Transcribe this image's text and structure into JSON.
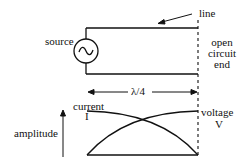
{
  "labels": {
    "line": "line",
    "source": "source",
    "open_circuit_end": [
      "open",
      "circuit",
      "end"
    ],
    "quarter_wave": "λ/4",
    "current": "current",
    "current_symbol": "I",
    "voltage": "voltage",
    "voltage_symbol": "V",
    "amplitude": "amplitude"
  },
  "colors": {
    "stroke": "#111111",
    "background": "#ffffff"
  }
}
